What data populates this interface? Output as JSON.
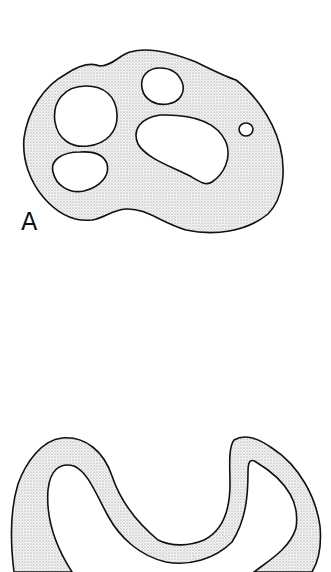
{
  "figure": {
    "panels": [
      {
        "label": "A",
        "description": "cross-section with stippled tissue and five openings",
        "openings": 5
      },
      {
        "label": "",
        "description": "curved stippled band (second cross-section, cropped at bottom)"
      }
    ]
  },
  "colors": {
    "outline": "#111111",
    "stipple": "#8a8a8a",
    "fill": "#f2f2f2",
    "background": "#ffffff"
  }
}
